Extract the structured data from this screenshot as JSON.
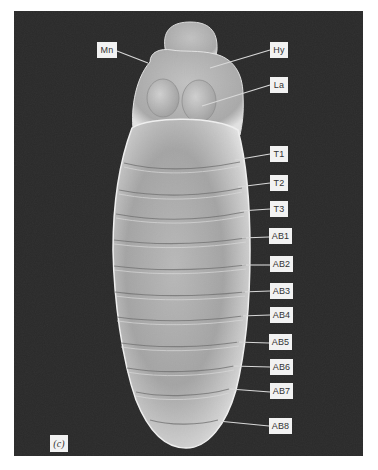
{
  "figure": {
    "panel_label": "(c)",
    "background_color": "#2a2a2a",
    "label_box_color": "#f2f2f2",
    "labels": [
      {
        "id": "Mn",
        "text": "Mn",
        "box": [
          97,
          42,
          20,
          16
        ],
        "pointer": [
          [
            117,
            51
          ],
          [
            148,
            63
          ]
        ]
      },
      {
        "id": "Hy",
        "text": "Hy",
        "box": [
          270,
          42,
          18,
          16
        ],
        "pointer": [
          [
            270,
            50
          ],
          [
            210,
            68
          ]
        ]
      },
      {
        "id": "La",
        "text": "La",
        "box": [
          270,
          77,
          18,
          16
        ],
        "pointer": [
          [
            270,
            85
          ],
          [
            202,
            106
          ]
        ]
      },
      {
        "id": "T1",
        "text": "T1",
        "box": [
          270,
          146,
          18,
          16
        ],
        "pointer": [
          [
            270,
            154
          ],
          [
            235,
            160
          ]
        ]
      },
      {
        "id": "T2",
        "text": "T2",
        "box": [
          270,
          175,
          18,
          16
        ],
        "pointer": [
          [
            270,
            183
          ],
          [
            238,
            187
          ]
        ]
      },
      {
        "id": "T3",
        "text": "T3",
        "box": [
          270,
          201,
          18,
          16
        ],
        "pointer": [
          [
            270,
            209
          ],
          [
            240,
            211
          ]
        ]
      },
      {
        "id": "AB1",
        "text": "AB1",
        "box": [
          269,
          228,
          23,
          16
        ],
        "pointer": [
          [
            269,
            237
          ],
          [
            242,
            238
          ]
        ]
      },
      {
        "id": "AB2",
        "text": "AB2",
        "box": [
          270,
          256,
          23,
          16
        ],
        "pointer": [
          [
            270,
            265
          ],
          [
            242,
            265
          ]
        ]
      },
      {
        "id": "AB3",
        "text": "AB3",
        "box": [
          270,
          283,
          23,
          16
        ],
        "pointer": [
          [
            270,
            291
          ],
          [
            242,
            292
          ]
        ]
      },
      {
        "id": "AB4",
        "text": "AB4",
        "box": [
          270,
          307,
          23,
          16
        ],
        "pointer": [
          [
            270,
            315
          ],
          [
            241,
            316
          ]
        ]
      },
      {
        "id": "AB5",
        "text": "AB5",
        "box": [
          269,
          334,
          23,
          16
        ],
        "pointer": [
          [
            269,
            343
          ],
          [
            237,
            342
          ]
        ]
      },
      {
        "id": "AB6",
        "text": "AB6",
        "box": [
          270,
          359,
          23,
          16
        ],
        "pointer": [
          [
            270,
            367
          ],
          [
            233,
            366
          ]
        ]
      },
      {
        "id": "AB7",
        "text": "AB7",
        "box": [
          270,
          383,
          23,
          16
        ],
        "pointer": [
          [
            270,
            392
          ],
          [
            230,
            389
          ]
        ]
      },
      {
        "id": "AB8",
        "text": "AB8",
        "box": [
          269,
          418,
          23,
          16
        ],
        "pointer": [
          [
            269,
            426
          ],
          [
            218,
            421
          ]
        ]
      }
    ],
    "panel_tag_box": [
      50,
      435,
      18,
      17
    ]
  }
}
